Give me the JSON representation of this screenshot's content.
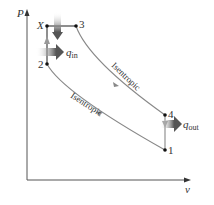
{
  "diagram": {
    "axes": {
      "y_label": "P",
      "x_label": "v"
    },
    "points": [
      {
        "id": "X",
        "label": "X",
        "x": 47,
        "y": 26
      },
      {
        "id": "3",
        "label": "3",
        "x": 76,
        "y": 26
      },
      {
        "id": "2",
        "label": "2",
        "x": 47,
        "y": 64
      },
      {
        "id": "4",
        "label": "4",
        "x": 165,
        "y": 115
      },
      {
        "id": "1",
        "label": "1",
        "x": 165,
        "y": 150
      }
    ],
    "processes": [
      {
        "from": "1",
        "to": "2",
        "label": "Isentropic"
      },
      {
        "from": "2",
        "to": "X",
        "label": ""
      },
      {
        "from": "X",
        "to": "3",
        "label": ""
      },
      {
        "from": "3",
        "to": "4",
        "label": "Isentropic"
      },
      {
        "from": "4",
        "to": "1",
        "label": ""
      }
    ],
    "heat": {
      "in_symbol": "q",
      "in_sub": "in",
      "out_symbol": "q",
      "out_sub": "out"
    },
    "colors": {
      "curve": "#888888",
      "axis": "#555555",
      "point": "#111111",
      "arrow": "#666666"
    }
  }
}
